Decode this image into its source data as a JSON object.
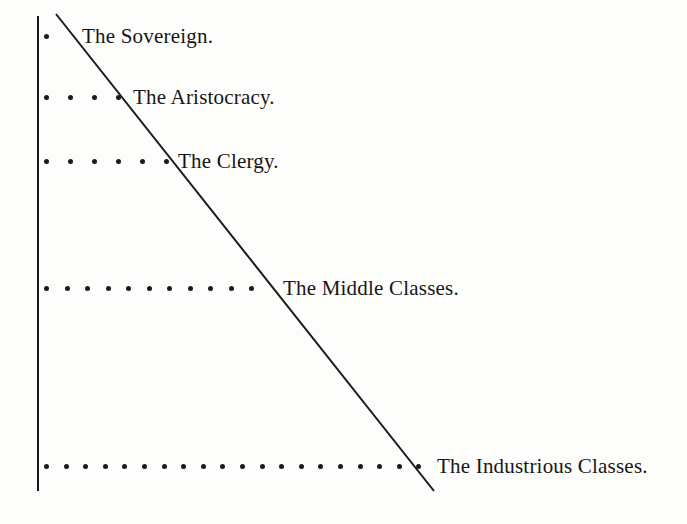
{
  "figure": {
    "background_color": "#fdfdfc",
    "ink_color": "#1a1a1a"
  },
  "axis": {
    "vertical_line": {
      "x": 38,
      "y_top": 16,
      "y_bottom": 491,
      "width": 2
    },
    "diagonal_line": {
      "x1": 56,
      "y1": 14,
      "x2": 434,
      "y2": 491,
      "width": 2
    }
  },
  "chart_data": {
    "type": "bar",
    "subtitle": "",
    "xlabel": "",
    "ylabel": "",
    "orientation": "horizontal",
    "units": "dots",
    "grid": false,
    "legend": false,
    "categories": [
      "The Sovereign.",
      "The Aristocracy.",
      "The Clergy.",
      "The Middle Classes.",
      "The Industrious Classes."
    ],
    "values": [
      1,
      4,
      6,
      11,
      20
    ],
    "xlim": [
      0,
      20
    ],
    "note": "Each category is represented by a row of dots; row length grows toward the base of the social pyramid, bounded by a descending diagonal line."
  },
  "rows": [
    {
      "id": "sovereign",
      "label": "The Sovereign.",
      "dot_count": 1,
      "y": 36,
      "dot_start_x": 44,
      "dot_spacing": 24,
      "label_x": 82
    },
    {
      "id": "aristocracy",
      "label": "The Aristocracy.",
      "dot_count": 4,
      "y": 97,
      "dot_start_x": 44,
      "dot_spacing": 24,
      "label_x": 133
    },
    {
      "id": "clergy",
      "label": "The Clergy.",
      "dot_count": 6,
      "y": 161,
      "dot_start_x": 44,
      "dot_spacing": 24,
      "label_x": 178
    },
    {
      "id": "middle-classes",
      "label": "The Middle Classes.",
      "dot_count": 11,
      "y": 288,
      "dot_start_x": 44,
      "dot_spacing": 20.5,
      "label_x": 283
    },
    {
      "id": "industrious-classes",
      "label": "The Industrious Classes.",
      "dot_count": 20,
      "y": 466,
      "dot_start_x": 44,
      "dot_spacing": 19.6,
      "label_x": 437
    }
  ]
}
